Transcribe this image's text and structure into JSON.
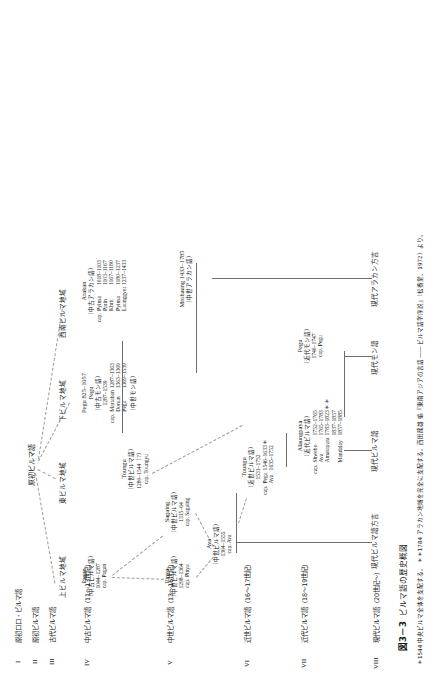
{
  "figure": {
    "caption_number": "図3－3",
    "caption_title": "ビルマ語の歴史概図",
    "footnote": "＊1544 中央ビルマ全体を支配する。 ＊＊1784 アラカン地域を完全に支配する。西田龍雄 編『東南アジアの言語 ―― ビルマ語学序説』（松香堂、1972）より。",
    "proto_label": "原初ビルマ語"
  },
  "stages": [
    {
      "roman": "I",
      "label": "原初ロロ・ビルマ語"
    },
    {
      "roman": "II",
      "label": "原初ビルマ語"
    },
    {
      "roman": "III",
      "label": "古代ビルマ語"
    },
    {
      "roman": "IV",
      "label": "中古ビルマ語（11〜13世紀）"
    },
    {
      "roman": "V",
      "label": "中世ビルマ語（13〜16世紀）"
    },
    {
      "roman": "VI",
      "label": "近世ビルマ語（16〜17世紀）"
    },
    {
      "roman": "VII",
      "label": "近代ビルマ語（18〜19世紀）"
    },
    {
      "roman": "VIII",
      "label": "現代ビルマ語（20世紀〜）"
    }
  ],
  "regions": [
    {
      "name": "上ビルマ地域"
    },
    {
      "name": "東ビルマ地域"
    },
    {
      "name": "下ビルマ地域"
    },
    {
      "name": "西南ビルマ地域"
    }
  ],
  "blocks": {
    "pagan": {
      "head": "Pagan",
      "lang": "（中古ビルマ語）",
      "years": "1044–1287",
      "cap": "cap. Pagan"
    },
    "pinya": {
      "head": "Pinya",
      "lang": "（中世ビルマ語）",
      "years": "1298–1364",
      "cap": "cap. Pinya"
    },
    "sagaing": {
      "head": "Sagaing",
      "lang": "（中世ビルマ語）",
      "years": "1315–64",
      "cap": "cap. Sagaing"
    },
    "ava": {
      "head": "Ava",
      "lang": "（中世ビルマ語）",
      "years": "1364–1555",
      "cap": "cap. Ava"
    },
    "toungoo_mid": {
      "head": "Toungu",
      "lang": "（中世ビルマ語）",
      "years": "1280–1544（?）",
      "cap": "cap. Toungyu"
    },
    "toungoo_early_modern": {
      "head": "Toungu",
      "lang": "（近世ビルマ語）",
      "years": "1531–1752",
      "cap_label": "cap.",
      "caps": [
        {
          "name": "Pegu",
          "years": "1546–1633＊"
        },
        {
          "name": "Ava",
          "years": "1635–1752"
        }
      ]
    },
    "alaungpaya": {
      "head": "Alaungpaya",
      "lang": "（近代ビルマ語）",
      "cap_label": "cap.",
      "caps": [
        {
          "name": "Shwebo",
          "years": "1752–1765"
        },
        {
          "name": "Ava",
          "years": "1765–1783"
        },
        {
          "name": "Amarapura",
          "years": "1783–1823＊＊"
        },
        {
          "name": "",
          "years": "1837–1857"
        },
        {
          "name": "Mandalay",
          "years": "1857–1885"
        }
      ]
    },
    "pegu_old": {
      "head": "Pegu 825–1057",
      "head2": "Pegu",
      "lang": "（中古モン語）",
      "years": "1287–1539",
      "cap_label": "cap.",
      "caps": [
        {
          "name": "Martaban",
          "years": "1287–1363"
        },
        {
          "name": "Donun",
          "years": "1363–1369"
        },
        {
          "name": "Pegu",
          "years": "1369–1539"
        }
      ],
      "lang2": "（中世モン語）"
    },
    "pegu_modern": {
      "head": "Pegu",
      "lang": "（近代モン語）",
      "years": "1740–1747",
      "cap": "cap. Pegu"
    },
    "arakan": {
      "head": "Arakan",
      "lang": "（中古アラカン語）",
      "cap_label": "cap.",
      "caps": [
        {
          "name": "Pyinsa",
          "years": "1018–1103"
        },
        {
          "name": "Parin",
          "years": "1103–1167"
        },
        {
          "name": "Khrit",
          "years": "1167–1180"
        },
        {
          "name": "Pyinsa",
          "years": "1180–1237"
        },
        {
          "name": "Launggyet",
          "years": "1237–1433"
        }
      ]
    },
    "mrohaung": {
      "head": "Mrohaung 1433–1785",
      "lang": "（中世アラカン語）"
    }
  },
  "modern": [
    {
      "label": "現代ビルマ語方言"
    },
    {
      "label": "現代ビルマ語"
    },
    {
      "label": "現代モン語"
    },
    {
      "label": "現代アラカン方言"
    }
  ]
}
